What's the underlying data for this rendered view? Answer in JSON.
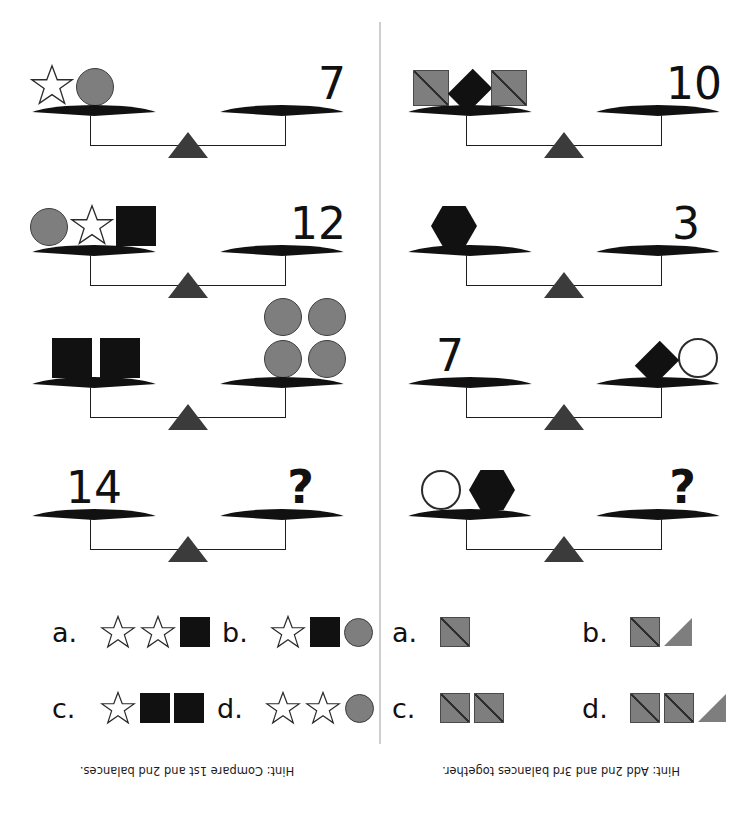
{
  "page": {
    "type": "balance-puzzle-worksheet",
    "background": "#ffffff",
    "shape_colors": {
      "gray_fill": "#7e7e7e",
      "black_fill": "#111111",
      "white_fill": "#ffffff",
      "outline": "#3d3d3d",
      "divider": "#cfcfcf",
      "fulcrum": "#3b3b3b"
    }
  },
  "left_panel": {
    "hint": "Hint: Compare 1st and 2nd balances.",
    "balances": [
      {
        "index": 1,
        "left_items": [
          "star-white",
          "circle-gray"
        ],
        "right_value": "7"
      },
      {
        "index": 2,
        "left_items": [
          "circle-gray",
          "star-white",
          "square-black"
        ],
        "right_value": "12"
      },
      {
        "index": 3,
        "left_items": [
          "square-black",
          "square-black"
        ],
        "right_items": [
          "circle-gray",
          "circle-gray",
          "circle-gray",
          "circle-gray"
        ]
      },
      {
        "index": 4,
        "left_value": "14",
        "right_value": "?"
      }
    ],
    "answers": [
      {
        "label": "a.",
        "items": [
          "star-white",
          "star-white",
          "square-black"
        ]
      },
      {
        "label": "b.",
        "items": [
          "star-white",
          "square-black",
          "circle-gray"
        ]
      },
      {
        "label": "c.",
        "items": [
          "star-white",
          "square-black",
          "square-black"
        ]
      },
      {
        "label": "d.",
        "items": [
          "star-white",
          "star-white",
          "circle-gray"
        ]
      }
    ]
  },
  "right_panel": {
    "hint": "Hint: Add 2nd and 3rd balances together.",
    "balances": [
      {
        "index": 1,
        "left_items": [
          "square-gray-diagonal",
          "diamond-black",
          "square-gray-diagonal"
        ],
        "right_value": "10"
      },
      {
        "index": 2,
        "left_items": [
          "hexagon-black"
        ],
        "right_value": "3"
      },
      {
        "index": 3,
        "left_value": "7",
        "right_items": [
          "diamond-black",
          "circle-white"
        ]
      },
      {
        "index": 4,
        "left_items": [
          "circle-white",
          "hexagon-black"
        ],
        "right_value": "?"
      }
    ],
    "answers": [
      {
        "label": "a.",
        "items": [
          "square-gray-diagonal"
        ]
      },
      {
        "label": "b.",
        "items": [
          "square-gray-diagonal",
          "triangle-gray"
        ]
      },
      {
        "label": "c.",
        "items": [
          "square-gray-diagonal",
          "square-gray-diagonal"
        ]
      },
      {
        "label": "d.",
        "items": [
          "square-gray-diagonal",
          "square-gray-diagonal",
          "triangle-gray"
        ]
      }
    ]
  }
}
